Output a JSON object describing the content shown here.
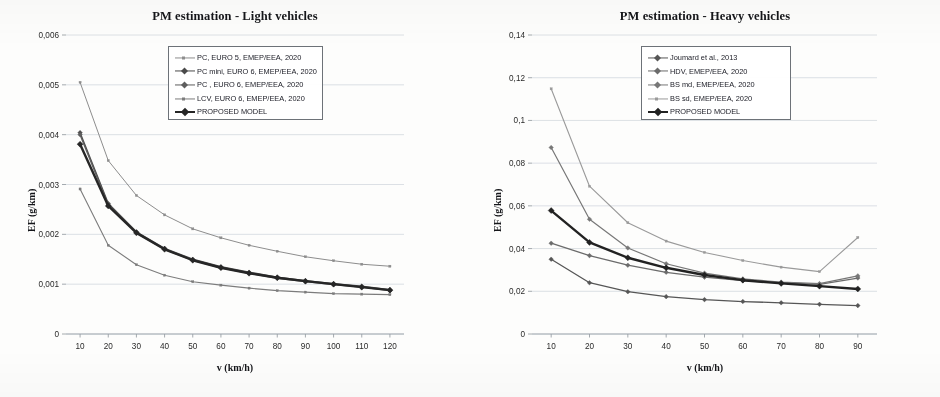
{
  "figure": {
    "background": "#fdfdfc",
    "panels": [
      "light",
      "heavy"
    ]
  },
  "chart_data": [
    {
      "type": "line",
      "id": "light",
      "title": "PM estimation - Light vehicles",
      "xlabel": "v (km/h)",
      "ylabel": "EF (g/km)",
      "x": [
        10,
        20,
        30,
        40,
        50,
        60,
        70,
        80,
        90,
        100,
        110,
        120
      ],
      "xticks": [
        "10",
        "20",
        "30",
        "40",
        "50",
        "60",
        "70",
        "80",
        "90",
        "100",
        "110",
        "120"
      ],
      "yticks": [
        "0",
        "0,001",
        "0,002",
        "0,003",
        "0,004",
        "0,005",
        "0,006"
      ],
      "ytick_values": [
        0,
        0.001,
        0.002,
        0.003,
        0.004,
        0.005,
        0.006
      ],
      "xlim": [
        5,
        125
      ],
      "ylim": [
        0,
        0.006
      ],
      "grid": true,
      "legend_position": "top-center",
      "series": [
        {
          "name": "PC, EURO 5,  EMEP/EEA, 2020",
          "color": "#8d8d8d",
          "width": 1.0,
          "marker": "small",
          "values": [
            0.00505,
            0.00348,
            0.00278,
            0.00239,
            0.00211,
            0.00193,
            0.00178,
            0.00166,
            0.00155,
            0.00147,
            0.0014,
            0.00136
          ]
        },
        {
          "name": "PC mini, EURO 6, EMEP/EEA, 2020",
          "color": "#4a4a4a",
          "width": 1.4,
          "marker": "diamond",
          "values": [
            0.00404,
            0.00262,
            0.00205,
            0.00172,
            0.0015,
            0.00135,
            0.00124,
            0.00114,
            0.00107,
            0.00101,
            0.00096,
            0.00089
          ]
        },
        {
          "name": "PC , EURO 6, EMEP/EEA, 2020",
          "color": "#5e5e5e",
          "width": 1.4,
          "marker": "diamond",
          "values": [
            0.004,
            0.00259,
            0.00203,
            0.0017,
            0.00148,
            0.00133,
            0.00122,
            0.00112,
            0.00105,
            0.00099,
            0.00094,
            0.00087
          ]
        },
        {
          "name": "LCV, EURO 6,  EMEP/EEA, 2020",
          "color": "#7c7c7c",
          "width": 1.1,
          "marker": "small",
          "values": [
            0.00291,
            0.00178,
            0.00139,
            0.00118,
            0.00105,
            0.00098,
            0.00092,
            0.00087,
            0.00084,
            0.00081,
            0.0008,
            0.00079
          ]
        },
        {
          "name": "PROPOSED MODEL",
          "color": "#262626",
          "width": 2.4,
          "marker": "diamond",
          "values": [
            0.00381,
            0.00257,
            0.00203,
            0.0017,
            0.00148,
            0.00133,
            0.00122,
            0.00113,
            0.00106,
            0.001,
            0.00094,
            0.00088
          ]
        }
      ]
    },
    {
      "type": "line",
      "id": "heavy",
      "title": "PM estimation - Heavy vehicles",
      "xlabel": "v (km/h)",
      "ylabel": "EF (g/km)",
      "x": [
        10,
        20,
        30,
        40,
        50,
        60,
        70,
        80,
        90
      ],
      "xticks": [
        "10",
        "20",
        "30",
        "40",
        "50",
        "60",
        "70",
        "80",
        "90"
      ],
      "yticks": [
        "0",
        "0,02",
        "0,04",
        "0,06",
        "0,08",
        "0,1",
        "0,12",
        "0,14"
      ],
      "ytick_values": [
        0,
        0.02,
        0.04,
        0.06,
        0.08,
        0.1,
        0.12,
        0.14
      ],
      "xlim": [
        5,
        95
      ],
      "ylim": [
        0,
        0.14
      ],
      "grid": true,
      "legend_position": "top-center",
      "series": [
        {
          "name": "Joumard et al., 2013",
          "color": "#565656",
          "width": 1.3,
          "marker": "diamond",
          "values": [
            0.035,
            0.024,
            0.0198,
            0.0175,
            0.0161,
            0.0152,
            0.0146,
            0.0139,
            0.0133
          ]
        },
        {
          "name": "HDV, EMEP/EEA, 2020",
          "color": "#6b6b6b",
          "width": 1.3,
          "marker": "diamond",
          "values": [
            0.0425,
            0.0367,
            0.0322,
            0.0289,
            0.0266,
            0.025,
            0.024,
            0.0232,
            0.0262
          ]
        },
        {
          "name": "BS md, EMEP/EEA, 2020",
          "color": "#777777",
          "width": 1.2,
          "marker": "diamond",
          "values": [
            0.0873,
            0.0537,
            0.0403,
            0.0329,
            0.0285,
            0.0258,
            0.0243,
            0.0236,
            0.0272
          ]
        },
        {
          "name": "BS sd, EMEP/EEA, 2020",
          "color": "#9a9a9a",
          "width": 1.1,
          "marker": "small",
          "values": [
            0.1148,
            0.0692,
            0.0521,
            0.0435,
            0.0382,
            0.0344,
            0.0313,
            0.0292,
            0.0452
          ]
        },
        {
          "name": "PROPOSED MODEL",
          "color": "#222222",
          "width": 2.4,
          "marker": "diamond",
          "values": [
            0.0578,
            0.0429,
            0.0357,
            0.031,
            0.0276,
            0.0252,
            0.0237,
            0.0224,
            0.0211
          ]
        }
      ]
    }
  ]
}
